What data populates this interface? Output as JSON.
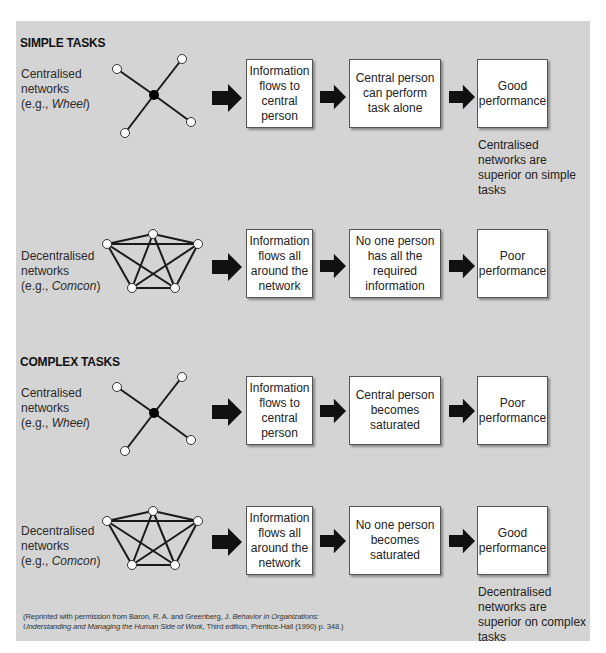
{
  "colors": {
    "panel_background": "#d4d4d4",
    "box_background": "#ffffff",
    "arrow": "#111111",
    "hub_node": "#000000",
    "outer_node": "#ffffff"
  },
  "sections": [
    {
      "title": "SIMPLE TASKS",
      "rows": [
        {
          "network_label_line1": "Centralised",
          "network_label_line2": "networks",
          "network_example_prefix": "(e.g., ",
          "network_example": "Wheel",
          "network_example_suffix": ")",
          "network_type": "wheel",
          "steps": [
            "Information flows to central person",
            "Central person can perform task alone",
            "Good performance"
          ],
          "note": "Centralised networks are superior on simple tasks"
        },
        {
          "network_label_line1": "Decentralised",
          "network_label_line2": "networks",
          "network_example_prefix": "(e.g., ",
          "network_example": "Comcon",
          "network_example_suffix": ")",
          "network_type": "comcon",
          "steps": [
            "Information flows all around the network",
            "No one person has all the required information",
            "Poor performance"
          ],
          "note": ""
        }
      ]
    },
    {
      "title": "COMPLEX TASKS",
      "rows": [
        {
          "network_label_line1": "Centralised",
          "network_label_line2": "networks",
          "network_example_prefix": "(e.g., ",
          "network_example": "Wheel",
          "network_example_suffix": ")",
          "network_type": "wheel",
          "steps": [
            "Information flows to central person",
            "Central person becomes saturated",
            "Poor performance"
          ],
          "note": ""
        },
        {
          "network_label_line1": "Decentralised",
          "network_label_line2": "networks",
          "network_example_prefix": "(e.g., ",
          "network_example": "Comcon",
          "network_example_suffix": ")",
          "network_type": "comcon",
          "steps": [
            "Information flows all around the network",
            "No one person becomes saturated",
            "Good performance"
          ],
          "note": "Decentralised networks are superior on complex tasks"
        }
      ]
    }
  ],
  "citation": {
    "part1": "(Reprinted with permission from Baron, R. A. and Greenberg, J. ",
    "title_part1": "Behavior in Organizations:",
    "title_part2": "Understanding and Managing the Human Side of Work",
    "part2": ", Third edition, Prentice-Hall (1990) p. 348.)"
  }
}
